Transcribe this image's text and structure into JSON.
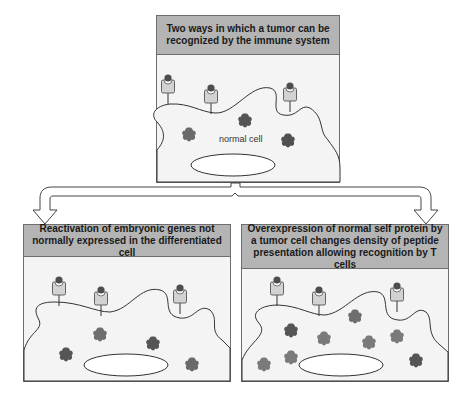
{
  "title": "Two ways in which a tumor can be recognized by the immune system",
  "top_panel": {
    "header": "Two ways in which a tumor can be recognized by the immune system",
    "cell_label": "normal cell"
  },
  "left_panel": {
    "header": "Reactivation of embryonic genes not normally expressed in the differentiated cell"
  },
  "right_panel": {
    "header": "Overexpression of normal self protein by a tumor cell changes density of peptide presentation allowing recognition by T cells"
  },
  "colors": {
    "header_bg": "#b4b4b4",
    "panel_bg": "#f4f4f4",
    "receptor_fill": "#d2d2d2",
    "peptide_dark": "#4d4d4d",
    "protein_dark": "#555555",
    "protein_light": "#808080"
  }
}
